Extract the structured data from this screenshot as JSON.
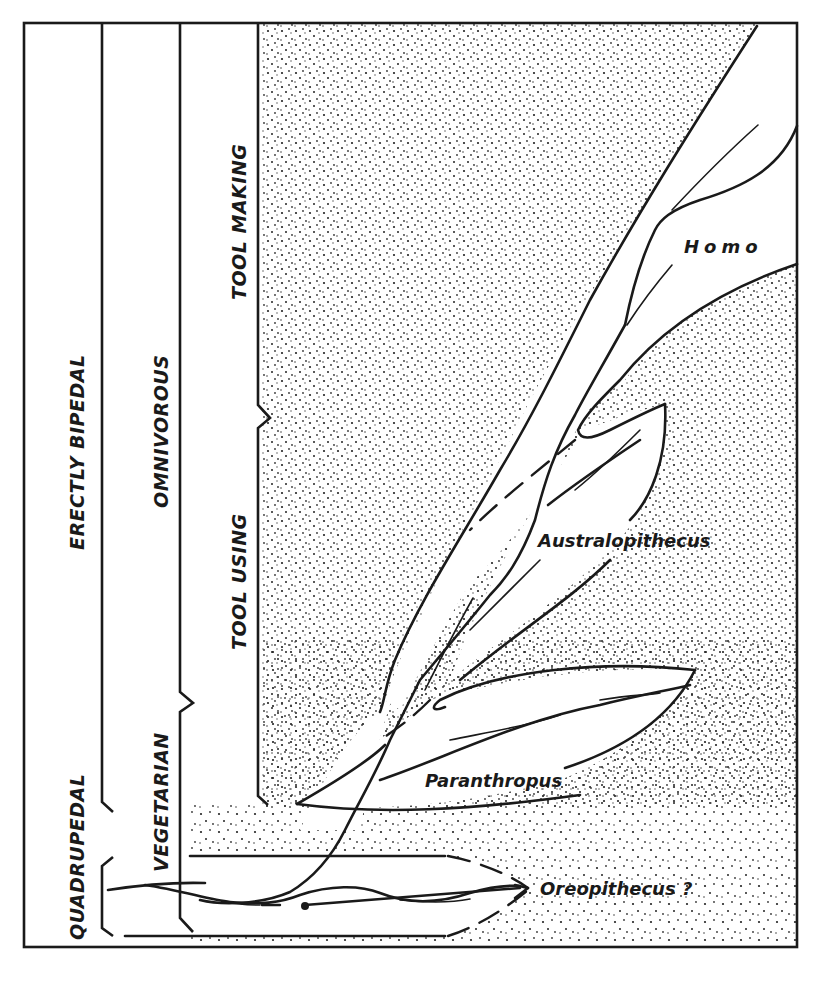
{
  "figure": {
    "type": "hominid-phylogeny-diagram",
    "background_pattern": "stippled-dots",
    "ink_color": "#1a1a1a",
    "paper_color": "#ffffff"
  },
  "columns": {
    "locomotion": {
      "lower_label": "QUADRUPEDAL",
      "upper_label": "ERECTLY BIPEDAL"
    },
    "diet": {
      "lower_label": "VEGETARIAN",
      "upper_label": "OMNIVOROUS"
    },
    "tools": {
      "lower_label": "TOOL USING",
      "upper_label": "TOOL MAKING"
    }
  },
  "lineages": {
    "homo": {
      "label": "Homo"
    },
    "australopithecus": {
      "label": "Australopithecus"
    },
    "paranthropus": {
      "label": "Paranthropus"
    },
    "oreopithecus": {
      "label": "Oreopithecus ?"
    }
  }
}
